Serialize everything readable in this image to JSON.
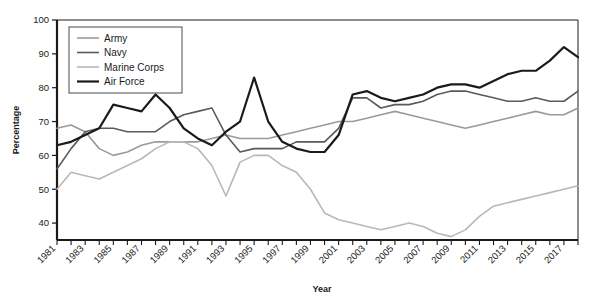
{
  "chart_data": {
    "type": "line",
    "title": "",
    "xlabel": "Year",
    "ylabel": "Percentage",
    "xlim": [
      1981,
      2018
    ],
    "ylim": [
      35,
      100
    ],
    "yticks": [
      40,
      50,
      60,
      70,
      80,
      90,
      100
    ],
    "grid": false,
    "legend_position": "top-left",
    "x": [
      1981,
      1982,
      1983,
      1984,
      1985,
      1986,
      1987,
      1988,
      1989,
      1990,
      1991,
      1992,
      1993,
      1994,
      1995,
      1996,
      1997,
      1998,
      1999,
      2000,
      2001,
      2002,
      2003,
      2004,
      2005,
      2006,
      2007,
      2008,
      2009,
      2010,
      2011,
      2012,
      2013,
      2014,
      2015,
      2016,
      2017,
      2018
    ],
    "series": [
      {
        "name": "Army",
        "color": "#9a9a9a",
        "width": 1.6,
        "values": [
          68,
          69,
          67,
          62,
          60,
          61,
          63,
          64,
          64,
          64,
          64,
          65,
          66,
          65,
          65,
          65,
          66,
          67,
          68,
          69,
          70,
          70,
          71,
          72,
          73,
          72,
          71,
          70,
          69,
          68,
          69,
          70,
          71,
          72,
          73,
          72,
          72,
          74
        ]
      },
      {
        "name": "Navy",
        "color": "#5a5a5a",
        "width": 1.6,
        "values": [
          56,
          62,
          67,
          68,
          68,
          67,
          67,
          67,
          70,
          72,
          73,
          74,
          66,
          61,
          62,
          62,
          62,
          64,
          64,
          64,
          68,
          77,
          77,
          74,
          75,
          75,
          76,
          78,
          79,
          79,
          78,
          77,
          76,
          76,
          77,
          76,
          76,
          79
        ]
      },
      {
        "name": "Marine Corps",
        "color": "#b8b8b8",
        "width": 1.6,
        "values": [
          50,
          55,
          54,
          53,
          55,
          57,
          59,
          62,
          64,
          64,
          62,
          57,
          48,
          58,
          60,
          60,
          57,
          55,
          50,
          43,
          41,
          40,
          39,
          38,
          39,
          40,
          39,
          37,
          36,
          38,
          42,
          45,
          46,
          47,
          48,
          49,
          50,
          51
        ]
      },
      {
        "name": "Air Force",
        "color": "#1a1a1a",
        "width": 2.2,
        "values": [
          63,
          64,
          66,
          68,
          75,
          74,
          73,
          78,
          74,
          68,
          65,
          63,
          67,
          70,
          83,
          70,
          64,
          62,
          61,
          61,
          66,
          78,
          79,
          77,
          76,
          77,
          78,
          80,
          81,
          81,
          80,
          82,
          84,
          85,
          85,
          88,
          92,
          89
        ]
      }
    ]
  },
  "axes": {
    "ylabel": "Percentage",
    "xlabel": "Year",
    "ytick_labels": [
      "40",
      "50",
      "60",
      "70",
      "80",
      "90",
      "100"
    ],
    "xtick_labels": [
      "1981",
      "1983",
      "1985",
      "1987",
      "1989",
      "1991",
      "1993",
      "1995",
      "1997",
      "1999",
      "2001",
      "2003",
      "2005",
      "2007",
      "2009",
      "2011",
      "2013",
      "2015",
      "2017"
    ]
  },
  "legend": {
    "items": [
      {
        "label": "Army"
      },
      {
        "label": "Navy"
      },
      {
        "label": "Marine Corps"
      },
      {
        "label": "Air Force"
      }
    ]
  }
}
